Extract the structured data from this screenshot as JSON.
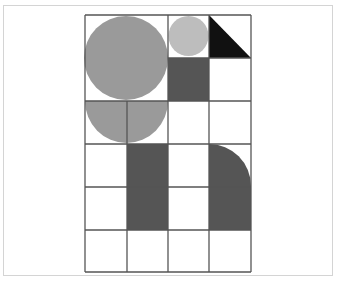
{
  "figure": {
    "grid": {
      "columns": 4,
      "rows": 6,
      "x_lines": [
        85,
        127,
        168,
        209,
        251
      ],
      "y_lines": [
        15,
        58,
        101,
        144,
        187,
        230,
        272
      ],
      "line_color": "#555555"
    },
    "colors": {
      "light_gray": "#bdbdbd",
      "mid_gray": "#9a9a9a",
      "dark_gray": "#555555",
      "black": "#111111",
      "frame": "#d4d4d4"
    },
    "shapes": [
      {
        "name": "large-circle",
        "type": "circle",
        "cells": "cols 1-2, rows 1-2",
        "color": "mid_gray"
      },
      {
        "name": "small-circle",
        "type": "circle",
        "cells": "col 3, row 1",
        "color": "light_gray"
      },
      {
        "name": "black-triangle",
        "type": "right-triangle",
        "cells": "col 4, row 1",
        "color": "black"
      },
      {
        "name": "dark-square",
        "type": "square",
        "cells": "col 3, row 2",
        "color": "dark_gray"
      },
      {
        "name": "half-circle",
        "type": "semicircle",
        "cells": "cols 1-2, row 3",
        "color": "mid_gray"
      },
      {
        "name": "dark-rectangle",
        "type": "rectangle",
        "cells": "col 2, rows 4-5",
        "color": "dark_gray"
      },
      {
        "name": "rounded-rectangle",
        "type": "quarter-round-rectangle",
        "cells": "col 4, rows 4-5",
        "color": "dark_gray"
      }
    ]
  }
}
